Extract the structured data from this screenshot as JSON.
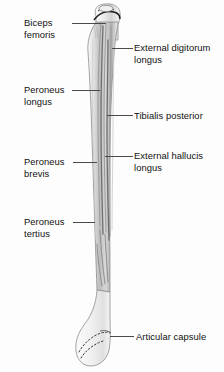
{
  "figure": {
    "background_color": "#fdfdfd",
    "bone_fill": "#f2f2f2",
    "bone_outline": "#8b8b8b",
    "striation_color": "#9a9a9a",
    "label_color": "#111111",
    "leader_color": "#4a4a4a"
  },
  "labels": {
    "biceps_femoris": "Biceps\nfemoris",
    "external_digitorum_longus": "External digitorum\nlongus",
    "peroneus_longus": "Peroneus\nlongus",
    "tibialis_posterior": "Tibialis posterior",
    "external_hallucis_longus": "External hallucis\nlongus",
    "peroneus_brevis": "Peroneus\nbrevis",
    "peroneus_tertius": "Peroneus\ntertius",
    "articular_capsule": "Articular capsule"
  },
  "callouts": [
    {
      "id": "biceps-femoris",
      "text": "Biceps\nfemoris",
      "side": "left",
      "label_x": 24,
      "label_y": 17,
      "leader_x": 72,
      "leader_y": 23,
      "leader_w": 34
    },
    {
      "id": "external-digitorum-longus",
      "text": "External digitorum\nlongus",
      "side": "right",
      "label_x": 134,
      "label_y": 42,
      "leader_x": 112,
      "leader_y": 48,
      "leader_w": 21
    },
    {
      "id": "peroneus-longus",
      "text": "Peroneus\nlongus",
      "side": "left",
      "label_x": 24,
      "label_y": 84,
      "leader_x": 72,
      "leader_y": 90,
      "leader_w": 28
    },
    {
      "id": "tibialis-posterior",
      "text": "Tibialis posterior",
      "side": "right",
      "label_x": 134,
      "label_y": 110,
      "leader_x": 107,
      "leader_y": 115,
      "leader_w": 26
    },
    {
      "id": "external-hallucis-longus",
      "text": "External hallucis\nlongus",
      "side": "right",
      "label_x": 134,
      "label_y": 150,
      "leader_x": 105,
      "leader_y": 156,
      "leader_w": 28
    },
    {
      "id": "peroneus-brevis",
      "text": "Peroneus\nbrevis",
      "side": "left",
      "label_x": 24,
      "label_y": 156,
      "leader_x": 73,
      "leader_y": 162,
      "leader_w": 24
    },
    {
      "id": "peroneus-tertius",
      "text": "Peroneus\ntertius",
      "side": "left",
      "label_x": 24,
      "label_y": 216,
      "leader_x": 73,
      "leader_y": 222,
      "leader_w": 22
    },
    {
      "id": "articular-capsule",
      "text": "Articular capsule",
      "side": "right",
      "label_x": 136,
      "label_y": 331,
      "leader_x": 110,
      "leader_y": 336,
      "leader_w": 24
    }
  ],
  "anatomy_parts": [
    {
      "name": "fibular-head",
      "description": "Head of fibula (apex / styloid process)"
    },
    {
      "name": "fibular-neck",
      "description": "Neck of fibula"
    },
    {
      "name": "fibular-shaft",
      "description": "Shaft (body) of fibula with interosseous border striations"
    },
    {
      "name": "lateral-malleolus",
      "description": "Lateral malleolus (distal end)"
    },
    {
      "name": "capsule-margin",
      "description": "Dotted articular capsule attachment margin"
    }
  ]
}
